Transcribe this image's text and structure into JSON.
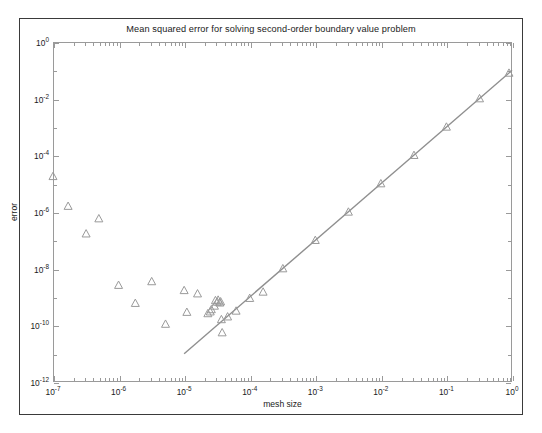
{
  "figure": {
    "title": "Mean squared error for solving second-order boundary value problem",
    "xlabel": "mesh size",
    "ylabel": "error",
    "background": "#ffffff",
    "frame_color": "#3a3a3a",
    "axis_color": "#9a9a9a",
    "marker_color": "#9a9a9a",
    "line_color": "#8f8f8f"
  },
  "x_tick_labels": [
    {
      "exp": "-7",
      "mantissa": "10"
    },
    {
      "exp": "-6",
      "mantissa": "10"
    },
    {
      "exp": "-5",
      "mantissa": "10"
    },
    {
      "exp": "-4",
      "mantissa": "10"
    },
    {
      "exp": "-3",
      "mantissa": "10"
    },
    {
      "exp": "-2",
      "mantissa": "10"
    },
    {
      "exp": "-1",
      "mantissa": "10"
    },
    {
      "exp": "0",
      "mantissa": "10"
    }
  ],
  "y_tick_labels": [
    {
      "exp": "0",
      "mantissa": "10"
    },
    {
      "exp": "-2",
      "mantissa": "10"
    },
    {
      "exp": "-4",
      "mantissa": "10"
    },
    {
      "exp": "-6",
      "mantissa": "10"
    },
    {
      "exp": "-8",
      "mantissa": "10"
    },
    {
      "exp": "-10",
      "mantissa": "10"
    },
    {
      "exp": "-12",
      "mantissa": "10"
    }
  ],
  "chart_data": {
    "type": "scatter",
    "title": "Mean squared error for solving second-order boundary value problem",
    "xlabel": "mesh size",
    "ylabel": "error",
    "xscale": "log",
    "yscale": "log",
    "xlim": [
      1e-07,
      1
    ],
    "ylim": [
      1e-12,
      1
    ],
    "grid": false,
    "legend": null,
    "series": [
      {
        "name": "measured error",
        "marker": "triangle-up",
        "marker_color": "#9a9a9a",
        "line": false,
        "points": [
          {
            "x": 1e-07,
            "y": 1.8e-05
          },
          {
            "x": 1.7e-07,
            "y": 1.6e-06
          },
          {
            "x": 3.2e-07,
            "y": 1.7e-07
          },
          {
            "x": 5e-07,
            "y": 5.8e-07
          },
          {
            "x": 1e-06,
            "y": 2.6e-09
          },
          {
            "x": 1.8e-06,
            "y": 6e-10
          },
          {
            "x": 3.2e-06,
            "y": 3.5e-09
          },
          {
            "x": 5.2e-06,
            "y": 1.1e-10
          },
          {
            "x": 1e-05,
            "y": 1.7e-09
          },
          {
            "x": 1.1e-05,
            "y": 2.9e-10
          },
          {
            "x": 1.6e-05,
            "y": 1.3e-09
          },
          {
            "x": 2.3e-05,
            "y": 2.6e-10
          },
          {
            "x": 2.5e-05,
            "y": 3e-10
          },
          {
            "x": 2.6e-05,
            "y": 3.6e-10
          },
          {
            "x": 2.9e-05,
            "y": 4.8e-10
          },
          {
            "x": 3e-05,
            "y": 7.5e-10
          },
          {
            "x": 3.2e-05,
            "y": 6.6e-10
          },
          {
            "x": 3.3e-05,
            "y": 7.8e-10
          },
          {
            "x": 3.5e-05,
            "y": 6.2e-10
          },
          {
            "x": 3.6e-05,
            "y": 6.8e-10
          },
          {
            "x": 3.7e-05,
            "y": 1.6e-10
          },
          {
            "x": 3.8e-05,
            "y": 5.5e-11
          },
          {
            "x": 4.6e-05,
            "y": 2e-10
          },
          {
            "x": 6.2e-05,
            "y": 3.2e-10
          },
          {
            "x": 0.0001,
            "y": 9e-10
          },
          {
            "x": 0.00016,
            "y": 1.5e-09
          },
          {
            "x": 0.00032,
            "y": 1e-08
          },
          {
            "x": 0.001,
            "y": 1e-07
          },
          {
            "x": 0.0032,
            "y": 1e-06
          },
          {
            "x": 0.01,
            "y": 1e-05
          },
          {
            "x": 0.032,
            "y": 0.0001
          },
          {
            "x": 0.1,
            "y": 0.001
          },
          {
            "x": 0.32,
            "y": 0.01
          },
          {
            "x": 0.9,
            "y": 0.08
          }
        ]
      },
      {
        "name": "second-order reference slope",
        "marker": "none",
        "line": true,
        "line_color": "#8f8f8f",
        "slope": 2,
        "points": [
          {
            "x": 1e-05,
            "y": 1e-11
          },
          {
            "x": 1.0,
            "y": 0.1
          }
        ]
      }
    ]
  }
}
